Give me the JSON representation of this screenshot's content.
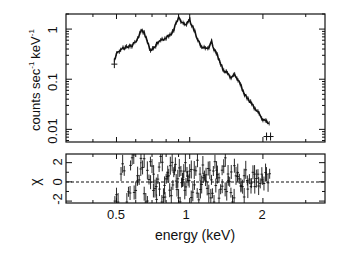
{
  "chart_data": {
    "type": "scatter",
    "title": "",
    "panels": [
      {
        "name": "spectrum",
        "xlabel": "energy (keV)",
        "ylabel": "counts sec ^-1 keV ^-1",
        "yscale": "log",
        "xscale": "log",
        "xlim": [
          0.31,
          3.6
        ],
        "ylim": [
          0.0056,
          2.0
        ],
        "ytick_labels": [
          "0.01",
          "0.1",
          "1"
        ],
        "ytick_values": [
          0.01,
          0.1,
          1
        ],
        "series": [
          {
            "name": "data (with error bars)",
            "x": [
              0.49,
              0.5,
              0.52,
              0.55,
              0.58,
              0.61,
              0.63,
              0.65,
              0.67,
              0.69,
              0.71,
              0.74,
              0.77,
              0.8,
              0.83,
              0.86,
              0.88,
              0.9,
              0.92,
              0.95,
              0.97,
              1.0,
              1.02,
              1.05,
              1.08,
              1.12,
              1.16,
              1.2,
              1.23,
              1.26,
              1.3,
              1.34,
              1.38,
              1.43,
              1.48,
              1.53,
              1.58,
              1.63,
              1.68,
              1.74,
              1.8,
              1.86,
              1.93,
              2.0,
              2.07,
              2.15
            ],
            "y": [
              0.24,
              0.32,
              0.4,
              0.43,
              0.48,
              0.62,
              0.95,
              0.85,
              0.55,
              0.38,
              0.4,
              0.55,
              0.6,
              0.68,
              0.75,
              0.95,
              1.35,
              1.7,
              1.45,
              1.2,
              1.3,
              1.5,
              1.2,
              0.9,
              0.6,
              0.45,
              0.4,
              0.45,
              0.55,
              0.4,
              0.3,
              0.2,
              0.15,
              0.13,
              0.11,
              0.12,
              0.1,
              0.07,
              0.05,
              0.04,
              0.032,
              0.026,
              0.02,
              0.016,
              0.014,
              0.013
            ]
          }
        ]
      },
      {
        "name": "residuals",
        "ylabel": "χ",
        "ylim": [
          -2.2,
          2.9
        ],
        "ytick_labels": [
          "-2",
          "0",
          "2"
        ],
        "ytick_values": [
          -2,
          0,
          2
        ],
        "reference_line": 0,
        "series": [
          {
            "name": "chi residuals",
            "x": [
              0.5,
              0.53,
              0.56,
              0.58,
              0.6,
              0.62,
              0.64,
              0.66,
              0.68,
              0.7,
              0.72,
              0.74,
              0.76,
              0.78,
              0.8,
              0.82,
              0.84,
              0.86,
              0.88,
              0.9,
              0.92,
              0.94,
              0.96,
              0.98,
              1.0,
              1.03,
              1.06,
              1.09,
              1.12,
              1.15,
              1.18,
              1.21,
              1.24,
              1.27,
              1.3,
              1.34,
              1.38,
              1.42,
              1.46,
              1.5,
              1.55,
              1.6,
              1.65,
              1.7,
              1.76,
              1.82,
              1.88,
              1.95,
              2.02,
              2.1
            ],
            "y": [
              -2.0,
              1.2,
              -1.5,
              2.4,
              -0.6,
              0.8,
              2.2,
              -1.8,
              0.5,
              1.5,
              -1.2,
              -0.4,
              2.0,
              -2.0,
              0.3,
              1.0,
              -0.8,
              1.7,
              0.6,
              -1.5,
              0.9,
              -0.3,
              1.3,
              0.0,
              0.8,
              -1.0,
              1.6,
              -1.2,
              0.4,
              1.1,
              -0.6,
              0.9,
              -1.8,
              1.4,
              0.2,
              -1.0,
              1.8,
              -0.5,
              0.7,
              -1.6,
              1.0,
              0.3,
              -0.9,
              0.6,
              -0.4,
              0.5,
              0.2,
              0.1,
              0.4,
              0.6
            ]
          }
        ]
      }
    ],
    "xtick_labels": [
      "0.5",
      "1",
      "2"
    ],
    "xtick_values": [
      0.5,
      1,
      2
    ],
    "xlabel": "energy (keV)",
    "grid": false,
    "legend": "none"
  },
  "labels": {
    "ylabel_top": "counts sec",
    "ylabel_sup1": "-1",
    "ylabel_kev": "keV",
    "ylabel_sup2": "-1",
    "ylabel_bottom": "χ",
    "xlabel": "energy (keV)",
    "ytick_top": [
      "1",
      "0.1",
      "0.01"
    ],
    "ytick_bottom": [
      "2",
      "0",
      "-2"
    ],
    "xtick": [
      "0.5",
      "1",
      "2"
    ]
  },
  "colors": {
    "ink": "#111111",
    "background": "#ffffff"
  }
}
